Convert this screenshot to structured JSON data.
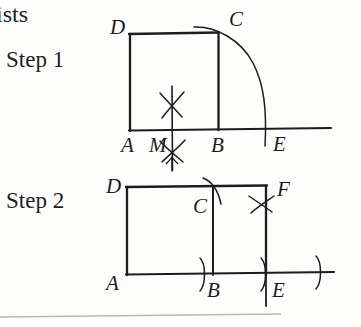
{
  "page": {
    "background_color": "#fdfdfc",
    "ink_color": "#1d1d1d",
    "width": 361,
    "height": 327
  },
  "text_fragments": {
    "cropped_word": "ists",
    "step1_label": "Step 1",
    "step2_label": "Step 2"
  },
  "figures": [
    {
      "id": "step-1",
      "caption": "Step 1",
      "description": "Square ABCD with perpendicular bisector construction at M and an arc from C down to E on the extended base line.",
      "point_labels": {
        "A": "A",
        "M": "M",
        "B": "B",
        "E": "E",
        "C": "C",
        "D": "D"
      },
      "construction_marks": [
        "arc-intersection-above-M",
        "arc-intersection-below-M",
        "vertical-line-through-M",
        "arc-C-to-E"
      ]
    },
    {
      "id": "step-2",
      "caption": "Step 2",
      "description": "Rectangle ADFE with interior vertical segment BC; compass arcs at B, E, C, F and far right tick on base line.",
      "point_labels": {
        "A": "A",
        "B": "B",
        "E": "E",
        "C": "C",
        "D": "D",
        "F": "F"
      },
      "construction_marks": [
        "arc-tick-at-B",
        "arc-tick-at-E",
        "arc-through-C",
        "arc-intersection-below-F",
        "arc-tick-far-right",
        "vertical-line-through-E"
      ]
    }
  ],
  "footer_rule": {
    "visible": true
  }
}
